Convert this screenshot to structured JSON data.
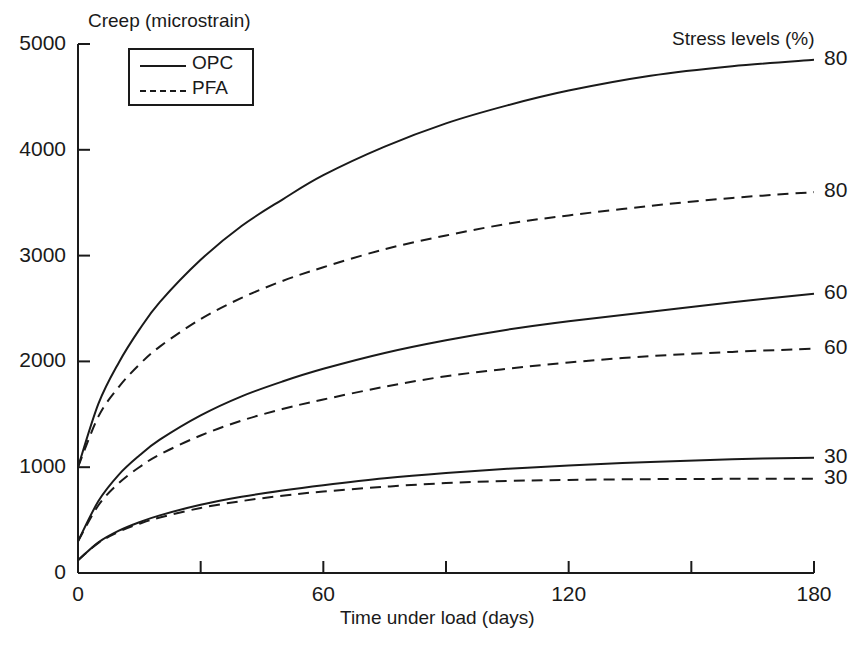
{
  "chart_data": {
    "type": "line",
    "title": "",
    "ylabel": "Creep (microstrain)",
    "xlabel": "Time under load (days)",
    "xlim": [
      0,
      180
    ],
    "ylim": [
      0,
      5000
    ],
    "grid": false,
    "x_ticks": [
      0,
      60,
      120,
      180
    ],
    "x_tick_labels": [
      "0",
      "60",
      "120",
      "180"
    ],
    "x_minor_ticks": [
      30,
      90,
      150
    ],
    "y_ticks": [
      0,
      1000,
      2000,
      3000,
      4000,
      5000
    ],
    "y_tick_labels": [
      "0",
      "1000",
      "2000",
      "3000",
      "4000",
      "5000"
    ],
    "legend": {
      "position": "upper-left-inside",
      "entries": [
        {
          "label": "OPC",
          "style": "solid"
        },
        {
          "label": "PFA",
          "style": "dashed"
        }
      ]
    },
    "right_axis_title": "Stress levels (%)",
    "annotations": [
      {
        "text": "80",
        "series": "OPC 80%",
        "x": 180,
        "y": 4850
      },
      {
        "text": "80",
        "series": "PFA 80%",
        "x": 180,
        "y": 3600
      },
      {
        "text": "60",
        "series": "OPC 60%",
        "x": 180,
        "y": 2640
      },
      {
        "text": "60",
        "series": "PFA 60%",
        "x": 180,
        "y": 2120
      },
      {
        "text": "30",
        "series": "OPC 30%",
        "x": 180,
        "y": 1090
      },
      {
        "text": "30",
        "series": "PFA 30%",
        "x": 180,
        "y": 890
      }
    ],
    "x": [
      0,
      5,
      10,
      15,
      20,
      30,
      40,
      50,
      60,
      75,
      90,
      105,
      120,
      140,
      160,
      180
    ],
    "series": [
      {
        "name": "OPC 80%",
        "style": "solid",
        "stress_level": 80,
        "material": "OPC",
        "values": [
          1000,
          1600,
          1990,
          2300,
          2560,
          2960,
          3280,
          3530,
          3760,
          4030,
          4250,
          4420,
          4560,
          4700,
          4790,
          4850
        ]
      },
      {
        "name": "PFA 80%",
        "style": "dashed",
        "stress_level": 80,
        "material": "PFA",
        "values": [
          1000,
          1480,
          1760,
          1970,
          2140,
          2400,
          2600,
          2760,
          2890,
          3060,
          3190,
          3300,
          3380,
          3470,
          3545,
          3600
        ]
      },
      {
        "name": "OPC 60%",
        "style": "solid",
        "stress_level": 60,
        "material": "OPC",
        "values": [
          300,
          680,
          930,
          1110,
          1260,
          1490,
          1670,
          1810,
          1930,
          2080,
          2200,
          2300,
          2380,
          2470,
          2560,
          2640
        ]
      },
      {
        "name": "PFA 60%",
        "style": "dashed",
        "stress_level": 60,
        "material": "PFA",
        "values": [
          300,
          640,
          850,
          1000,
          1120,
          1300,
          1440,
          1550,
          1640,
          1760,
          1860,
          1930,
          1990,
          2050,
          2090,
          2120
        ]
      },
      {
        "name": "OPC 30%",
        "style": "solid",
        "stress_level": 30,
        "material": "OPC",
        "values": [
          120,
          290,
          400,
          480,
          545,
          645,
          720,
          780,
          830,
          895,
          945,
          985,
          1015,
          1050,
          1075,
          1090
        ]
      },
      {
        "name": "PFA 30%",
        "style": "dashed",
        "stress_level": 30,
        "material": "PFA",
        "values": [
          120,
          285,
          390,
          465,
          525,
          615,
          680,
          730,
          770,
          815,
          850,
          870,
          880,
          887,
          890,
          892
        ]
      }
    ]
  },
  "axis": {
    "y_title": "Creep (microstrain)",
    "x_title": "Time under load (days)",
    "stress_title": "Stress levels (%)"
  },
  "legend": {
    "opc": "OPC",
    "pfa": "PFA"
  },
  "colors": {
    "line": "#1a1a1a",
    "background": "#ffffff"
  }
}
